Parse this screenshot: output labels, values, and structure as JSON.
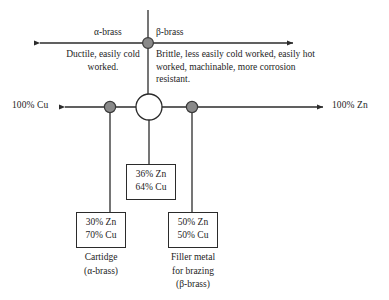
{
  "diagram": {
    "colors": {
      "line": "#2b2b2b",
      "node_fill": "#8a8a8a",
      "node_stroke": "#3a3a3a",
      "center_fill": "#ffffff",
      "text": "#1d1d1d",
      "background": "#ffffff"
    },
    "axis": {
      "left_end_label": "100% Cu",
      "right_end_label": "100% Zn"
    },
    "branches": {
      "alpha": {
        "head": "α-brass",
        "description": "Ductile, easily cold worked."
      },
      "beta": {
        "head": "β-brass",
        "description": "Brittle, less easily cold worked, easily hot worked, machinable, more corrosion resistant."
      }
    },
    "boxes": [
      {
        "id": "box-36",
        "line1": "36% Zn",
        "line2": "64% Cu",
        "caption": ""
      },
      {
        "id": "box-30",
        "line1": "30% Zn",
        "line2": "70% Cu",
        "caption": "Cartidge\n(α-brass)"
      },
      {
        "id": "box-50",
        "line1": "50% Zn",
        "line2": "50% Cu",
        "caption": "Filler metal\nfor brazing\n(β-brass)"
      }
    ],
    "nodes": [
      {
        "name": "alpha-beta-boundary-node",
        "x": 148,
        "y": 43
      },
      {
        "name": "cartidge-node",
        "x": 110,
        "y": 107
      },
      {
        "name": "center-node",
        "x": 149,
        "y": 107
      },
      {
        "name": "filler-node",
        "x": 192,
        "y": 107
      }
    ]
  }
}
